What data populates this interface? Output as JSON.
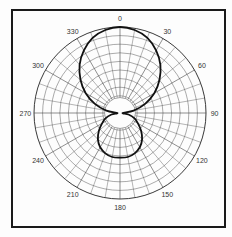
{
  "chart_data": {
    "type": "polar",
    "title": "",
    "angle_unit": "degrees",
    "angle_direction": "clockwise",
    "zero_location": "top",
    "angle_labels": [
      "0",
      "30",
      "60",
      "90",
      "120",
      "150",
      "180",
      "210",
      "240",
      "270",
      "300",
      "330"
    ],
    "angle_label_values": [
      0,
      30,
      60,
      90,
      120,
      150,
      180,
      210,
      240,
      270,
      300,
      330
    ],
    "radial_range": [
      0,
      1
    ],
    "grid": true,
    "series": [
      {
        "name": "pattern",
        "theta": [
          0,
          10,
          20,
          30,
          40,
          50,
          60,
          70,
          80,
          90,
          100,
          110,
          120,
          130,
          140,
          150,
          160,
          170,
          180,
          190,
          200,
          210,
          220,
          230,
          240,
          250,
          260,
          270,
          280,
          290,
          300,
          310,
          320,
          330,
          340,
          350,
          360
        ],
        "r": [
          1.0,
          0.98,
          0.93,
          0.84,
          0.73,
          0.6,
          0.46,
          0.31,
          0.16,
          0.03,
          0.1,
          0.18,
          0.24,
          0.32,
          0.4,
          0.46,
          0.5,
          0.52,
          0.52,
          0.52,
          0.5,
          0.46,
          0.4,
          0.32,
          0.24,
          0.18,
          0.1,
          0.03,
          0.16,
          0.31,
          0.46,
          0.6,
          0.73,
          0.84,
          0.93,
          0.98,
          1.0
        ]
      }
    ]
  }
}
